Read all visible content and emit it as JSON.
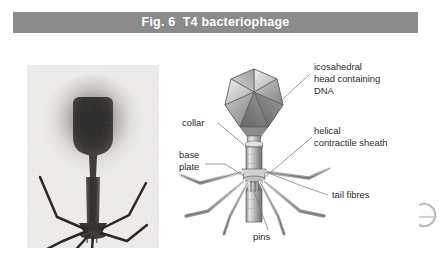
{
  "figure": {
    "title": "Fig. 6  T4 bacteriophage",
    "title_bar_color": "#8b8b8b",
    "title_text_color": "#ffffff"
  },
  "micrograph": {
    "name": "electron-micrograph-of-t4-bacteriophage",
    "description": "Greyscale electron micrograph showing a T4 bacteriophage with dark head, tail and splayed tail fibres on a pale background",
    "background_color": "#f2f2f0",
    "particle_color": "#1c1c1c",
    "halo_color": "#6e6a68"
  },
  "diagram": {
    "name": "t4-bacteriophage-labelled-diagram",
    "structure_fill": "#b8b8b8",
    "structure_stroke": "#4a4a4a",
    "leader_color": "#6d6d6d",
    "labels": [
      {
        "id": "icosahedral-head",
        "lines": [
          "icosahedral",
          "head containing",
          "DNA"
        ],
        "side": "right"
      },
      {
        "id": "collar",
        "lines": [
          "collar"
        ],
        "side": "left"
      },
      {
        "id": "helical-contractile-sheath",
        "lines": [
          "helical",
          "contractile sheath"
        ],
        "side": "right"
      },
      {
        "id": "base-plate",
        "lines": [
          "base",
          "plate"
        ],
        "side": "left"
      },
      {
        "id": "tail-fibres",
        "lines": [
          "tail fibres"
        ],
        "side": "right"
      },
      {
        "id": "pins",
        "lines": [
          "pins"
        ],
        "side": "bottom"
      }
    ]
  },
  "corner_artifact": {
    "name": "page-corner-ring-artifact",
    "color": "#9a9a9a"
  }
}
